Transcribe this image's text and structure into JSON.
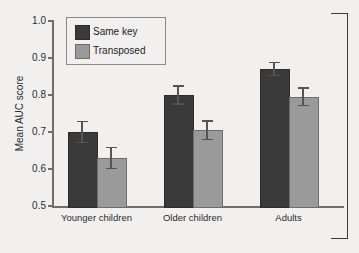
{
  "chart_data": {
    "type": "bar",
    "title": "",
    "xlabel": "",
    "ylabel": "Mean AUC score",
    "ylim": [
      0.5,
      1.0
    ],
    "yticks": [
      "1.0",
      "0.9",
      "0.8",
      "0.7",
      "0.6",
      "0.5"
    ],
    "grid": false,
    "legend_position": "top-left",
    "categories": [
      "Younger children",
      "Older children",
      "Adults"
    ],
    "series": [
      {
        "name": "Same key",
        "color": "#3a3a3a",
        "values": [
          0.7,
          0.8,
          0.87
        ],
        "errors": [
          0.028,
          0.024,
          0.018
        ]
      },
      {
        "name": "Transposed",
        "color": "#9a9a9a",
        "values": [
          0.63,
          0.705,
          0.795
        ],
        "errors": [
          0.028,
          0.025,
          0.024
        ]
      }
    ]
  },
  "axis": {
    "y_title": "Mean AUC score",
    "ticks": [
      {
        "label": "1.0",
        "value": 1.0
      },
      {
        "label": "0.9",
        "value": 0.9
      },
      {
        "label": "0.8",
        "value": 0.8
      },
      {
        "label": "0.7",
        "value": 0.7
      },
      {
        "label": "0.6",
        "value": 0.6
      },
      {
        "label": "0.5",
        "value": 0.5
      }
    ]
  },
  "legend": {
    "entries": [
      {
        "label": "Same key",
        "color": "#3a3a3a"
      },
      {
        "label": "Transposed",
        "color": "#9a9a9a"
      }
    ]
  },
  "colors": {
    "background": "#f1f0ee",
    "axis": "#6f6f6f",
    "text": "#2b2b2b",
    "series_same_key": "#3a3a3a",
    "series_transposed": "#9a9a9a",
    "error_bar": "#555555",
    "bracket": "#3a3a3a"
  }
}
